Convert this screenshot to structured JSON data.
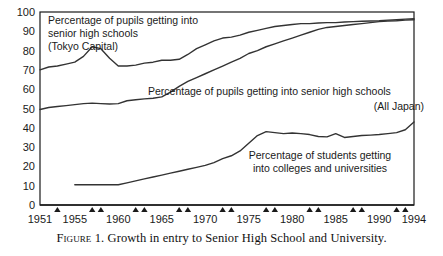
{
  "caption": {
    "label_prefix": "Figure",
    "number": "1.",
    "text": "Growth in entry to Senior High School and University.",
    "full": "Figure 1. Growth in entry to Senior High School and University."
  },
  "annotations": {
    "tokyo": {
      "line1": "Percentage of pupils getting into",
      "line2": "senior high schools",
      "line3": "(Tokyo Capital)"
    },
    "alljapan": {
      "line1": "Percentage of pupils getting into senior high schools",
      "line2": "(All Japan)"
    },
    "university": {
      "line1": "Percentage of students getting",
      "line2": "into colleges and universities"
    }
  },
  "chart_data": {
    "type": "line",
    "title": "",
    "subtitle": "",
    "xlabel": "",
    "ylabel": "",
    "xlim": [
      1951,
      1994
    ],
    "ylim": [
      0,
      100
    ],
    "grid": false,
    "legend_position": "inline-annotations",
    "ytick_labels": [
      "0",
      "10",
      "20",
      "30",
      "40",
      "50",
      "60",
      "70",
      "80",
      "90",
      "100"
    ],
    "yticks": [
      0,
      10,
      20,
      30,
      40,
      50,
      60,
      70,
      80,
      90,
      100
    ],
    "xtick_labels": [
      "1951",
      "1955",
      "1960",
      "1965",
      "1970",
      "1975",
      "1980",
      "1985",
      "1990",
      "1994"
    ],
    "xticks": [
      1951,
      1955,
      1960,
      1965,
      1970,
      1975,
      1980,
      1985,
      1990,
      1994
    ],
    "marker_years": [
      1953,
      1957,
      1958,
      1962,
      1963,
      1967,
      1968,
      1972,
      1973,
      1977,
      1978,
      1982,
      1983,
      1987,
      1988,
      1992,
      1993
    ],
    "series": [
      {
        "name": "Percentage of pupils getting into senior high schools (Tokyo Capital)",
        "short_name": "Tokyo Capital",
        "color": "#333333",
        "x": [
          1951,
          1952,
          1953,
          1954,
          1955,
          1956,
          1957,
          1958,
          1959,
          1960,
          1961,
          1962,
          1963,
          1964,
          1965,
          1966,
          1967,
          1968,
          1969,
          1970,
          1971,
          1972,
          1973,
          1974,
          1975,
          1976,
          1977,
          1978,
          1979,
          1980,
          1981,
          1982,
          1983,
          1984,
          1985,
          1986,
          1987,
          1988,
          1989,
          1990,
          1991,
          1992,
          1993,
          1994
        ],
        "values": [
          70,
          71.5,
          72,
          73,
          74,
          77,
          82,
          81,
          76,
          72,
          72,
          72.5,
          73.5,
          74,
          75,
          75,
          75.5,
          78,
          81,
          83,
          85,
          86.5,
          87,
          88,
          89.5,
          90.5,
          91.5,
          92.5,
          93,
          93.5,
          94,
          94,
          94.3,
          94.5,
          94.5,
          94.8,
          95,
          95.2,
          95.3,
          95.5,
          95.8,
          96,
          96.3,
          96.5
        ]
      },
      {
        "name": "Percentage of pupils getting into senior high schools (All Japan)",
        "short_name": "All Japan",
        "color": "#333333",
        "x": [
          1951,
          1952,
          1953,
          1954,
          1955,
          1956,
          1957,
          1958,
          1959,
          1960,
          1961,
          1962,
          1963,
          1964,
          1965,
          1966,
          1967,
          1968,
          1969,
          1970,
          1971,
          1972,
          1973,
          1974,
          1975,
          1976,
          1977,
          1978,
          1979,
          1980,
          1981,
          1982,
          1983,
          1984,
          1985,
          1986,
          1987,
          1988,
          1989,
          1990,
          1991,
          1992,
          1993,
          1994
        ],
        "values": [
          49.5,
          50.5,
          51,
          51.5,
          52,
          52.5,
          52.8,
          52.5,
          52.3,
          52.5,
          54,
          54.5,
          55,
          55.3,
          56,
          58.5,
          61.5,
          64,
          66,
          68,
          70,
          72,
          74,
          76,
          78.5,
          80,
          82,
          83.5,
          85,
          86.5,
          88,
          89.5,
          91,
          92,
          92.5,
          93,
          93.5,
          94,
          94.5,
          95,
          95.3,
          95.5,
          95.8,
          96
        ]
      },
      {
        "name": "Percentage of students getting into colleges and universities",
        "short_name": "Colleges and universities",
        "color": "#333333",
        "x": [
          1955,
          1956,
          1957,
          1958,
          1959,
          1960,
          1961,
          1962,
          1963,
          1964,
          1965,
          1966,
          1967,
          1968,
          1969,
          1970,
          1971,
          1972,
          1973,
          1974,
          1975,
          1976,
          1977,
          1978,
          1979,
          1980,
          1981,
          1982,
          1983,
          1984,
          1985,
          1986,
          1987,
          1988,
          1989,
          1990,
          1991,
          1992,
          1993,
          1994
        ],
        "values": [
          10.5,
          10.5,
          10.5,
          10.5,
          10.5,
          10.5,
          11.5,
          12.5,
          13.5,
          14.5,
          15.5,
          16.5,
          17.5,
          18.5,
          19.5,
          20.5,
          22,
          24,
          25.5,
          28,
          32,
          36,
          38,
          37.5,
          37,
          37.3,
          37,
          36.5,
          35.5,
          35.3,
          37,
          35,
          35.5,
          36,
          36.2,
          36.5,
          37,
          37.5,
          39,
          43
        ]
      }
    ]
  }
}
